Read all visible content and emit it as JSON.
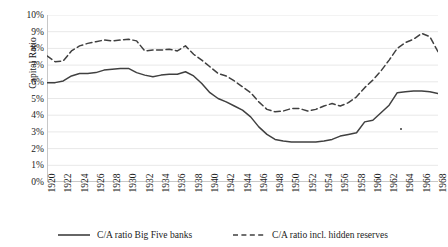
{
  "chart_data": {
    "type": "line",
    "title": "",
    "xlabel": "",
    "ylabel": "Capital Ratio",
    "ylim": [
      0,
      10
    ],
    "ytick_labels": [
      "10%",
      "9%",
      "8%",
      "7%",
      "6%",
      "5%",
      "4%",
      "3%",
      "2%",
      "1%",
      "0%"
    ],
    "ytick_values": [
      10,
      9,
      8,
      7,
      6,
      5,
      4,
      3,
      2,
      1,
      0
    ],
    "xlim": [
      1920,
      1968
    ],
    "xtick_labels": [
      "1920",
      "1922",
      "1924",
      "1926",
      "1928",
      "1930",
      "1932",
      "1934",
      "1936",
      "1938",
      "1940",
      "1942",
      "1944",
      "1946",
      "1948",
      "1950",
      "1952",
      "1954",
      "1956",
      "1958",
      "1960",
      "1962",
      "1964",
      "1966",
      "1968"
    ],
    "grid": true,
    "grid_axis": "y",
    "legend_position": "bottom",
    "x": [
      1920,
      1921,
      1922,
      1923,
      1924,
      1925,
      1926,
      1927,
      1928,
      1929,
      1930,
      1931,
      1932,
      1933,
      1934,
      1935,
      1936,
      1937,
      1938,
      1939,
      1940,
      1941,
      1942,
      1943,
      1944,
      1945,
      1946,
      1947,
      1948,
      1949,
      1950,
      1951,
      1952,
      1953,
      1954,
      1955,
      1956,
      1957,
      1958,
      1959,
      1960,
      1961,
      1962,
      1963,
      1964,
      1965,
      1966,
      1967,
      1968
    ],
    "series": [
      {
        "name": "C/A ratio Big Five banks",
        "style": "solid",
        "color": "#404040",
        "values": [
          5.95,
          5.95,
          6.05,
          6.35,
          6.5,
          6.5,
          6.55,
          6.7,
          6.75,
          6.8,
          6.8,
          6.55,
          6.4,
          6.3,
          6.4,
          6.45,
          6.45,
          6.6,
          6.35,
          5.9,
          5.35,
          5.0,
          4.8,
          4.55,
          4.3,
          3.9,
          3.3,
          2.85,
          2.55,
          2.45,
          2.4,
          2.4,
          2.4,
          2.4,
          2.45,
          2.55,
          2.75,
          2.85,
          2.95,
          3.6,
          3.7,
          4.15,
          4.6,
          5.35,
          5.4,
          5.45,
          5.45,
          5.4,
          5.3
        ]
      },
      {
        "name": "C/A ratio incl. hidden reserves",
        "style": "dashed",
        "color": "#404040",
        "values": [
          7.55,
          7.2,
          7.25,
          7.85,
          8.15,
          8.3,
          8.4,
          8.5,
          8.45,
          8.5,
          8.55,
          8.45,
          7.85,
          7.9,
          7.9,
          7.95,
          7.85,
          8.15,
          7.65,
          7.3,
          6.9,
          6.5,
          6.35,
          6.05,
          5.7,
          5.35,
          4.8,
          4.35,
          4.2,
          4.25,
          4.4,
          4.4,
          4.25,
          4.35,
          4.55,
          4.7,
          4.55,
          4.75,
          5.1,
          5.65,
          6.1,
          6.65,
          7.3,
          8.0,
          8.35,
          8.55,
          8.9,
          8.7,
          7.8
        ]
      }
    ],
    "legend": [
      {
        "label": "C/A ratio Big Five banks",
        "style": "solid"
      },
      {
        "label": "C/A ratio incl. hidden reserves",
        "style": "dashed"
      }
    ]
  }
}
